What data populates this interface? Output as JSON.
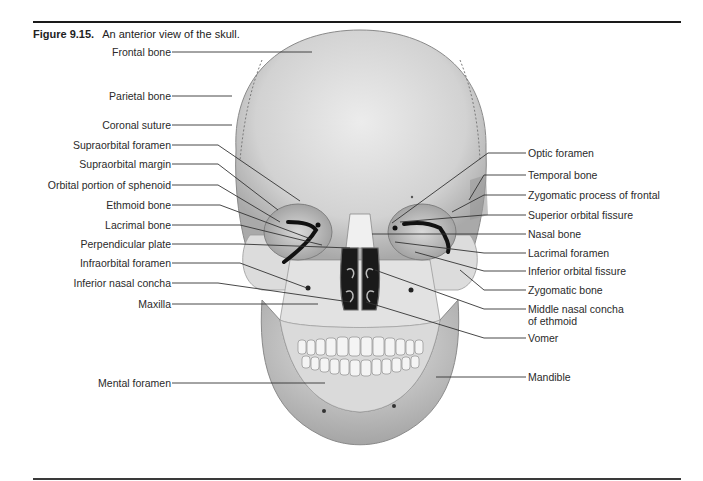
{
  "figure": {
    "number": "Figure 9.15.",
    "caption": "An anterior view of the skull."
  },
  "labels_left": [
    {
      "text": "Frontal bone",
      "y": 52
    },
    {
      "text": "Parietal bone",
      "y": 96
    },
    {
      "text": "Coronal suture",
      "y": 125
    },
    {
      "text": "Supraorbital foramen",
      "y": 145
    },
    {
      "text": "Supraorbital margin",
      "y": 164
    },
    {
      "text": "Orbital portion of sphenoid",
      "y": 185
    },
    {
      "text": "Ethmoid bone",
      "y": 205
    },
    {
      "text": "Lacrimal bone",
      "y": 225
    },
    {
      "text": "Perpendicular plate",
      "y": 244
    },
    {
      "text": "Infraorbital foramen",
      "y": 263
    },
    {
      "text": "Inferior nasal concha",
      "y": 283
    },
    {
      "text": "Maxilla",
      "y": 304
    },
    {
      "text": "Mental foramen",
      "y": 383
    }
  ],
  "labels_right": [
    {
      "text": "Optic foramen",
      "y": 153
    },
    {
      "text": "Temporal bone",
      "y": 175
    },
    {
      "text": "Zygomatic process of frontal",
      "y": 195
    },
    {
      "text": "Superior orbital fissure",
      "y": 215
    },
    {
      "text": "Nasal bone",
      "y": 234
    },
    {
      "text": "Lacrimal foramen",
      "y": 253
    },
    {
      "text": "Inferior orbital fissure",
      "y": 271
    },
    {
      "text": "Zygomatic bone",
      "y": 290
    },
    {
      "text": "Middle nasal concha",
      "y": 309
    },
    {
      "text": "of ethmoid",
      "y": 321
    },
    {
      "text": "Vomer",
      "y": 338
    },
    {
      "text": "Mandible",
      "y": 377
    }
  ]
}
